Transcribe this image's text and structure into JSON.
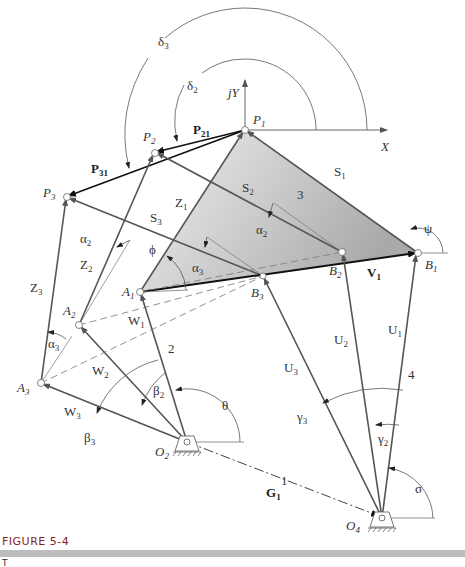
{
  "figure": {
    "caption": "FIGURE 5-4",
    "subcaption_visible": "T",
    "bar_color": "#bdbdbd",
    "caption_color": "#8a1e1e"
  },
  "axes": {
    "x_label": "X",
    "y_label": "jY"
  },
  "points": {
    "P1": {
      "name": "P",
      "sub": "1"
    },
    "P2": {
      "name": "P",
      "sub": "2"
    },
    "P3": {
      "name": "P",
      "sub": "3"
    },
    "A1": {
      "name": "A",
      "sub": "1"
    },
    "A2": {
      "name": "A",
      "sub": "2"
    },
    "A3": {
      "name": "A",
      "sub": "3"
    },
    "B1": {
      "name": "B",
      "sub": "1"
    },
    "B2": {
      "name": "B",
      "sub": "2"
    },
    "B3": {
      "name": "B",
      "sub": "3"
    },
    "O2": {
      "name": "O",
      "sub": "2"
    },
    "O4": {
      "name": "O",
      "sub": "4"
    }
  },
  "vectors": {
    "P21": {
      "name": "P",
      "sub": "21"
    },
    "P31": {
      "name": "P",
      "sub": "31"
    },
    "S1": {
      "name": "S",
      "sub": "1"
    },
    "S2": {
      "name": "S",
      "sub": "2"
    },
    "S3": {
      "name": "S",
      "sub": "3"
    },
    "Z1": {
      "name": "Z",
      "sub": "1"
    },
    "Z2": {
      "name": "Z",
      "sub": "2"
    },
    "Z3": {
      "name": "Z",
      "sub": "3"
    },
    "W1": {
      "name": "W",
      "sub": "1"
    },
    "W2": {
      "name": "W",
      "sub": "2"
    },
    "W3": {
      "name": "W",
      "sub": "3"
    },
    "U1": {
      "name": "U",
      "sub": "1"
    },
    "U2": {
      "name": "U",
      "sub": "2"
    },
    "U3": {
      "name": "U",
      "sub": "3"
    },
    "V1": {
      "name": "V",
      "sub": "1"
    },
    "G1": {
      "name": "G",
      "sub": "1"
    }
  },
  "angles": {
    "delta2": {
      "name": "δ",
      "sub": "2"
    },
    "delta3": {
      "name": "δ",
      "sub": "3"
    },
    "alpha2_upper": {
      "name": "α",
      "sub": "2"
    },
    "alpha2_left": {
      "name": "α",
      "sub": "2"
    },
    "alpha3_mid": {
      "name": "α",
      "sub": "3"
    },
    "alpha3_left": {
      "name": "α",
      "sub": "3"
    },
    "beta2": {
      "name": "β",
      "sub": "2"
    },
    "beta3": {
      "name": "β",
      "sub": "3"
    },
    "gamma2": {
      "name": "γ",
      "sub": "2"
    },
    "gamma3": {
      "name": "γ",
      "sub": "3"
    },
    "phi": {
      "name": "ϕ"
    },
    "psi": {
      "name": "ψ"
    },
    "theta": {
      "name": "θ"
    },
    "sigma": {
      "name": "σ"
    }
  },
  "links": {
    "ground": "1",
    "crank": "2",
    "coupler": "3",
    "rocker": "4"
  }
}
